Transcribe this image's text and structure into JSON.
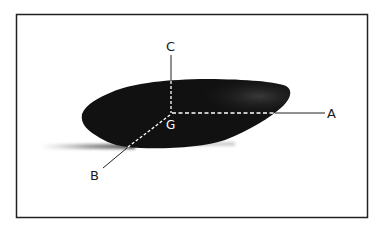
{
  "figure": {
    "frame_color": "#222222",
    "pebble_color": "#111111",
    "shadow_color": "#555555",
    "axis_line_color": "#222222",
    "dashed_color": "#ffffff"
  },
  "labels": {
    "axis_a": "A",
    "axis_b": "B",
    "axis_c": "C",
    "center_g": "G"
  }
}
